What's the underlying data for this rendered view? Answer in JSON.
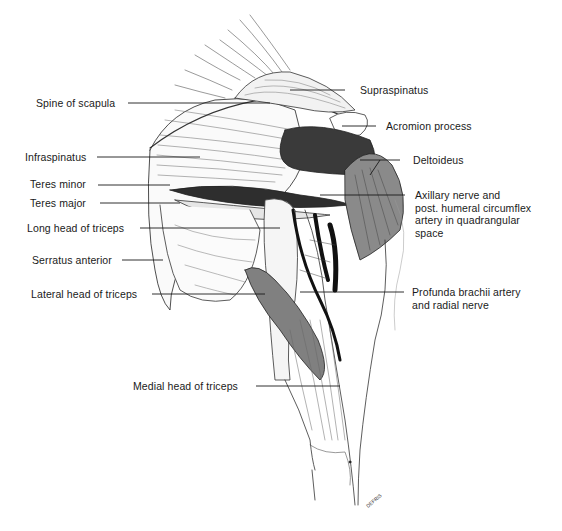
{
  "figure": {
    "signature": "DEFRIS"
  },
  "labels_left": [
    {
      "id": "spine-of-scapula",
      "text": "Spine of scapula"
    },
    {
      "id": "infraspinatus",
      "text": "Infraspinatus"
    },
    {
      "id": "teres-minor",
      "text": "Teres minor"
    },
    {
      "id": "teres-major",
      "text": "Teres major"
    },
    {
      "id": "long-head-of-triceps",
      "text": "Long head of triceps"
    },
    {
      "id": "serratus-anterior",
      "text": "Serratus anterior"
    },
    {
      "id": "lateral-head-of-triceps",
      "text": "Lateral head of triceps"
    },
    {
      "id": "medial-head-of-triceps",
      "text": "Medial head of triceps"
    }
  ],
  "labels_right": [
    {
      "id": "supraspinatus",
      "lines": [
        "Supraspinatus"
      ]
    },
    {
      "id": "acromion-process",
      "lines": [
        "Acromion process"
      ]
    },
    {
      "id": "deltoideus",
      "lines": [
        "Deltoideus"
      ]
    },
    {
      "id": "axillary-nerve",
      "lines": [
        "Axillary nerve and",
        "post. humeral circumflex",
        "artery in quadrangular",
        "space"
      ]
    },
    {
      "id": "profunda-brachii",
      "lines": [
        "Profunda brachii artery",
        "and radial nerve"
      ]
    }
  ]
}
